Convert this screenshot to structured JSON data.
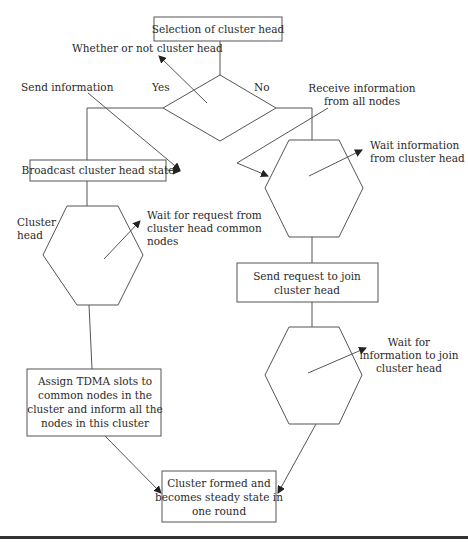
{
  "diagram": {
    "type": "flowchart",
    "nodes": {
      "selection": {
        "label": "Selection of cluster head"
      },
      "decision": {
        "label": ""
      },
      "broadcast": {
        "label": "Broadcast cluster head state"
      },
      "send_request": {
        "lines": [
          "Send request to join",
          "cluster head"
        ]
      },
      "assign": {
        "lines": [
          "Assign TDMA slots to",
          "common nodes in the",
          "cluster and inform all the",
          "nodes in this cluster"
        ]
      },
      "final": {
        "lines": [
          "Cluster formed and",
          "becomes steady state in",
          "one round"
        ]
      }
    },
    "annotations": {
      "whether": "Whether or not cluster head",
      "yes": "Yes",
      "no": "No",
      "send_info": "Send information",
      "receive_info": [
        "Receive information",
        "from all nodes"
      ],
      "wait_info_ch": [
        "Wait information",
        "from cluster head"
      ],
      "cluster_head": [
        "Cluster",
        "head"
      ],
      "wait_request": [
        "Wait for request from",
        "cluster head common",
        "nodes"
      ],
      "wait_join": [
        "Wait for",
        "information to join",
        "cluster head"
      ]
    }
  }
}
